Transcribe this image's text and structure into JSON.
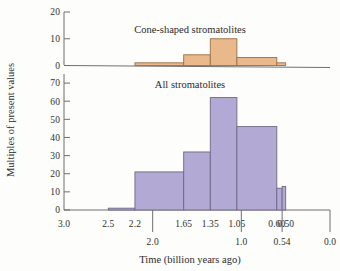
{
  "figure": {
    "y_axis_label": "Multiples of present values",
    "x_axis_label": "Time (billion years ago)"
  },
  "panels": {
    "top": {
      "title": "Cone-shaped stromatolites",
      "y_ticks": [
        "0",
        "10",
        "20"
      ]
    },
    "bottom": {
      "title": "All stromatolites",
      "y_ticks": [
        "0",
        "10",
        "20",
        "30",
        "40",
        "50",
        "60",
        "70"
      ]
    }
  },
  "x_axis": {
    "upper_ticks": [
      "3.0",
      "2.5",
      "2.2",
      "1.65",
      "1.35",
      "1.05",
      "0.60",
      "0.50"
    ],
    "lower_ticks": [
      "2.0",
      "1.0",
      "0.54",
      "0.0"
    ]
  },
  "colors": {
    "cone_fill": "#e9b98c",
    "cone_stroke": "#9b6f45",
    "all_fill": "#b2aad4",
    "all_stroke": "#6e6784",
    "axis": "#6f6f6f",
    "text": "#2b2b2b",
    "background": "#fdfdfb"
  },
  "chart_data": {
    "type": "bar",
    "xlabel": "Time (billion years ago)",
    "ylabel": "Multiples of present values",
    "note": "Two stacked histogram panels sharing one reversed time axis (3.0 billion years ago at left, 0.0 at right). Bars are binned by the upper-row tick boundaries.",
    "x_axis": {
      "reversed": true,
      "range": [
        3.0,
        0.0
      ],
      "upper_tick_values": [
        3.0,
        2.5,
        2.2,
        1.65,
        1.35,
        1.05,
        0.6,
        0.5
      ],
      "upper_tick_labels": [
        "3.0",
        "2.5",
        "2.2",
        "1.65",
        "1.35",
        "1.05",
        "0.60",
        "0.50"
      ],
      "lower_tick_values": [
        2.0,
        1.0,
        0.54,
        0.0
      ],
      "lower_tick_labels": [
        "2.0",
        "1.0",
        "0.54",
        "0.0"
      ]
    },
    "panels": [
      {
        "name": "Cone-shaped stromatolites",
        "title": "Cone-shaped stromatolites",
        "ylim": [
          0,
          20
        ],
        "yticks": [
          0,
          10,
          20
        ],
        "grid": false,
        "bins": [
          {
            "start": 2.2,
            "end": 1.65,
            "label": "2.2–1.65",
            "value": 1
          },
          {
            "start": 1.65,
            "end": 1.35,
            "label": "1.65–1.35",
            "value": 4
          },
          {
            "start": 1.35,
            "end": 1.05,
            "label": "1.35–1.05",
            "value": 10
          },
          {
            "start": 1.05,
            "end": 0.6,
            "label": "1.05–0.60",
            "value": 3
          },
          {
            "start": 0.6,
            "end": 0.5,
            "label": "0.60–0.50",
            "value": 1
          }
        ],
        "categories": [
          "2.2–1.65",
          "1.65–1.35",
          "1.35–1.05",
          "1.05–0.60",
          "0.60–0.50"
        ],
        "values": [
          1,
          4,
          10,
          3,
          1
        ]
      },
      {
        "name": "All stromatolites",
        "title": "All stromatolites",
        "ylim": [
          0,
          75
        ],
        "yticks": [
          0,
          10,
          20,
          30,
          40,
          50,
          60,
          70
        ],
        "grid": false,
        "bins": [
          {
            "start": 2.5,
            "end": 2.2,
            "label": "2.5–2.2",
            "value": 1
          },
          {
            "start": 2.2,
            "end": 1.65,
            "label": "2.2–1.65",
            "value": 21
          },
          {
            "start": 1.65,
            "end": 1.35,
            "label": "1.65–1.35",
            "value": 32
          },
          {
            "start": 1.35,
            "end": 1.05,
            "label": "1.35–1.05",
            "value": 62
          },
          {
            "start": 1.05,
            "end": 0.6,
            "label": "1.05–0.60",
            "value": 46
          },
          {
            "start": 0.6,
            "end": 0.54,
            "label": "0.60–0.54",
            "value": 12
          },
          {
            "start": 0.54,
            "end": 0.5,
            "label": "0.54–0.50",
            "value": 13
          }
        ],
        "categories": [
          "2.5–2.2",
          "2.2–1.65",
          "1.65–1.35",
          "1.35–1.05",
          "1.05–0.60",
          "0.60–0.54",
          "0.54–0.50"
        ],
        "values": [
          1,
          21,
          32,
          62,
          46,
          12,
          13
        ]
      }
    ]
  }
}
